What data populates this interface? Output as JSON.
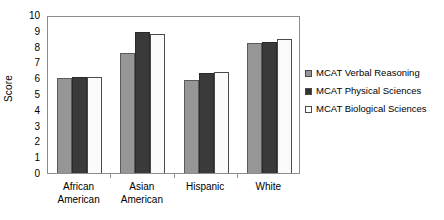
{
  "chart_data": {
    "type": "bar",
    "title": "",
    "subtitle": "",
    "xlabel": "",
    "ylabel": "Score",
    "ylim": [
      0,
      10
    ],
    "ytick_step": 1,
    "yticks": [
      0,
      1,
      2,
      3,
      4,
      5,
      6,
      7,
      8,
      9,
      10
    ],
    "ytick_labels": [
      "0",
      "1",
      "2",
      "3",
      "4",
      "5",
      "6",
      "7",
      "8",
      "9",
      "10"
    ],
    "grid": false,
    "legend_position": "right",
    "categories": [
      "African American",
      "Asian American",
      "Hispanic",
      "White"
    ],
    "category_label_lines": [
      [
        "African",
        "American"
      ],
      [
        "Asian",
        "American"
      ],
      [
        "Hispanic"
      ],
      [
        "White"
      ]
    ],
    "series": [
      {
        "name": "MCAT Verbal Reasoning",
        "color": "#969696",
        "values": [
          6.0,
          7.6,
          5.9,
          8.2
        ]
      },
      {
        "name": "MCAT Physical Sciences",
        "color": "#333333",
        "values": [
          6.1,
          8.9,
          6.3,
          8.3
        ]
      },
      {
        "name": "MCAT Biological Sciences",
        "color": "#ffffff",
        "values": [
          6.1,
          8.8,
          6.4,
          8.5
        ]
      }
    ]
  },
  "legend": {
    "items": [
      {
        "label": "MCAT Verbal Reasoning",
        "swatch": "legend-swatch-verbal-reasoning"
      },
      {
        "label": "MCAT Physical Sciences",
        "swatch": "legend-swatch-physical-sciences"
      },
      {
        "label": "MCAT Biological Sciences",
        "swatch": "legend-swatch-biological-sciences"
      }
    ]
  }
}
